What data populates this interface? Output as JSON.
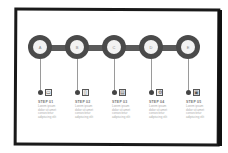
{
  "steps": [
    {
      "node_label": "A",
      "icon": "battery-icon",
      "icon_glyph": "▭",
      "title": "STEP 01",
      "body": "Lorem ipsum dolor sit amet consectetur adipiscing elit"
    },
    {
      "node_label": "B",
      "icon": "document-icon",
      "icon_glyph": "▯",
      "title": "STEP 02",
      "body": "Lorem ipsum dolor sit amet consectetur adipiscing elit"
    },
    {
      "node_label": "C",
      "icon": "file-icon",
      "icon_glyph": "▤",
      "title": "STEP 03",
      "body": "Lorem ipsum dolor sit amet consectetur adipiscing elit"
    },
    {
      "node_label": "D",
      "icon": "settings-icon",
      "icon_glyph": "⚙",
      "title": "STEP 04",
      "body": "Lorem ipsum dolor sit amet consectetur adipiscing elit"
    },
    {
      "node_label": "E",
      "icon": "save-icon",
      "icon_glyph": "▣",
      "title": "STEP 05",
      "body": "Lorem ipsum dolor sit amet consectetur adipiscing elit"
    }
  ],
  "colors": {
    "node": "#4a4a4a",
    "track": "#5a5a5a",
    "frame": "#1a1a1a"
  }
}
